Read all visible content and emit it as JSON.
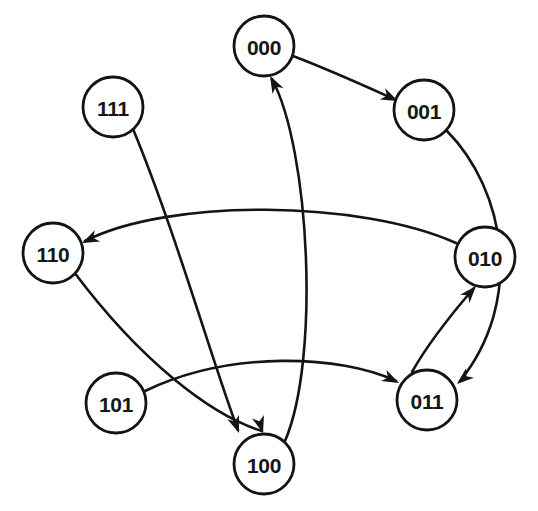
{
  "figure": {
    "kind": "state-transition-diagram",
    "caption_fragment": "",
    "background_color": "#ffffff",
    "stroke_color": "#141414",
    "node_fill_color": "#ffffff",
    "label_color": "#161616",
    "width": 538,
    "height": 511
  },
  "nodes": [
    {
      "id": "000",
      "label": "000",
      "cx": 264,
      "cy": 46,
      "r": 30
    },
    {
      "id": "001",
      "label": "001",
      "cx": 424,
      "cy": 110,
      "r": 30
    },
    {
      "id": "010",
      "label": "010",
      "cx": 485,
      "cy": 257,
      "r": 30
    },
    {
      "id": "011",
      "label": "011",
      "cx": 427,
      "cy": 400,
      "r": 30
    },
    {
      "id": "100",
      "label": "100",
      "cx": 264,
      "cy": 464,
      "r": 30
    },
    {
      "id": "101",
      "label": "101",
      "cx": 116,
      "cy": 403,
      "r": 30
    },
    {
      "id": "110",
      "label": "110",
      "cx": 53,
      "cy": 253,
      "r": 30
    },
    {
      "id": "111",
      "label": "111",
      "cx": 113,
      "cy": 107,
      "r": 30
    }
  ],
  "edges": [
    {
      "id": "e-000-001",
      "from": "000",
      "to": "001",
      "directed": true,
      "path": "M 293 56 C 330 70 365 86 396 100",
      "arrow_at": [
        398,
        101
      ],
      "arrow_angle": 25
    },
    {
      "id": "e-001-011",
      "from": "001",
      "to": "011",
      "directed": true,
      "path": "M 447 131 C 505 190 525 300 460 381",
      "arrow_at": [
        457,
        384
      ],
      "arrow_angle": 140
    },
    {
      "id": "e-011-010",
      "from": "011",
      "to": "010",
      "directed": true,
      "path": "M 412 372 C 430 340 455 310 474 288",
      "arrow_at": [
        476,
        286
      ],
      "arrow_angle": -49
    },
    {
      "id": "e-010-110",
      "from": "010",
      "to": "110",
      "directed": true,
      "path": "M 456 243 C 360 200 170 198 85 241",
      "arrow_at": [
        82,
        243
      ],
      "arrow_angle": 155
    },
    {
      "id": "e-110-100",
      "from": "110",
      "to": "100",
      "directed": true,
      "path": "M 74 272 C 140 360 210 415 262 431",
      "arrow_at": [
        263,
        433
      ],
      "arrow_angle": 73
    },
    {
      "id": "e-111-100",
      "from": "111",
      "to": "100",
      "directed": true,
      "path": "M 133 129 C 175 230 215 370 238 430",
      "arrow_at": [
        239,
        433
      ],
      "arrow_angle": 70
    },
    {
      "id": "e-101-011",
      "from": "101",
      "to": "011",
      "directed": true,
      "path": "M 145 391 C 230 350 340 355 396 381",
      "arrow_at": [
        399,
        383
      ],
      "arrow_angle": 26
    },
    {
      "id": "e-100-000",
      "from": "100",
      "to": "000",
      "directed": true,
      "path": "M 285 441 C 320 360 310 150 272 79",
      "arrow_at": [
        270,
        76
      ],
      "arrow_angle": -118
    }
  ],
  "transition_table": {
    "columns": [
      "present-state",
      "next-state"
    ],
    "rows": [
      [
        "000",
        "001"
      ],
      [
        "001",
        "011"
      ],
      [
        "011",
        "010"
      ],
      [
        "010",
        "110"
      ],
      [
        "110",
        "100"
      ],
      [
        "100",
        "000"
      ],
      [
        "111",
        "100"
      ],
      [
        "101",
        "011"
      ]
    ]
  }
}
